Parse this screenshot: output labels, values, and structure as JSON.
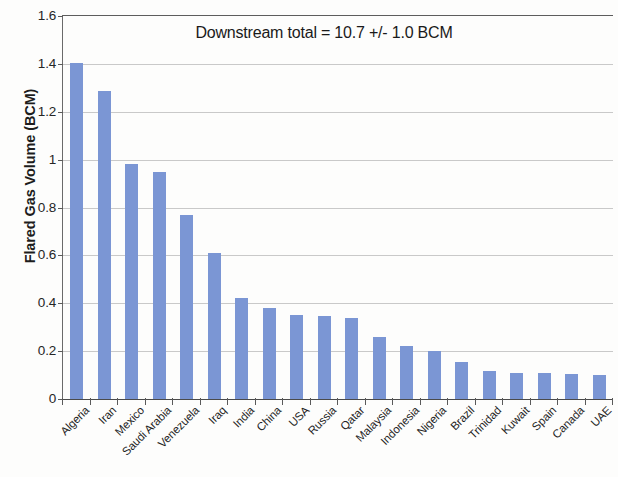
{
  "chart_data": {
    "type": "bar",
    "title": "",
    "annotation": "Downstream total = 10.7 +/- 1.0 BCM",
    "xlabel": "",
    "ylabel": "Flared Gas Volume (BCM)",
    "ylim": [
      0,
      1.6
    ],
    "yticks": [
      "0",
      "0.2",
      "0.4",
      "0.6",
      "0.8",
      "1",
      "1.2",
      "1.4",
      "1.6"
    ],
    "ytick_values": [
      0,
      0.2,
      0.4,
      0.6,
      0.8,
      1.0,
      1.2,
      1.4,
      1.6
    ],
    "grid": true,
    "legend": "none",
    "bar_color": "#7b96d4",
    "categories": [
      "Algeria",
      "Iran",
      "Mexico",
      "Saudi Arabia",
      "Venezuela",
      "Iraq",
      "India",
      "China",
      "USA",
      "Russia",
      "Qatar",
      "Malaysia",
      "Indonesia",
      "Nigeria",
      "Brazil",
      "Trinidad",
      "Kuwait",
      "Spain",
      "Canada",
      "UAE"
    ],
    "values": [
      1.405,
      1.285,
      0.98,
      0.95,
      0.77,
      0.61,
      0.42,
      0.38,
      0.35,
      0.345,
      0.34,
      0.26,
      0.22,
      0.2,
      0.155,
      0.115,
      0.11,
      0.11,
      0.105,
      0.1
    ]
  }
}
